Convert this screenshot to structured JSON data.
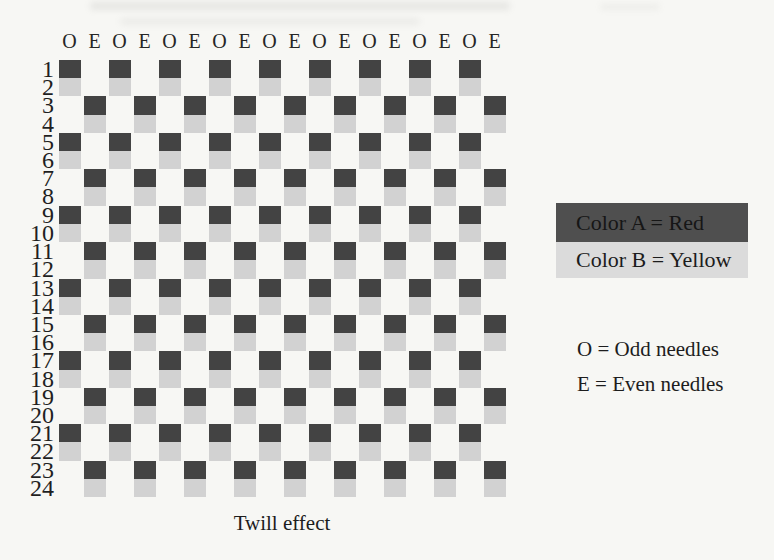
{
  "figure": {
    "caption": "Twill effect",
    "columns": 18,
    "courses": 24,
    "needle_header": [
      "O",
      "E",
      "O",
      "E",
      "O",
      "E",
      "O",
      "E",
      "O",
      "E",
      "O",
      "E",
      "O",
      "E",
      "O",
      "E",
      "O",
      "E"
    ],
    "course_numbers": [
      1,
      2,
      3,
      4,
      5,
      6,
      7,
      8,
      9,
      10,
      11,
      12,
      13,
      14,
      15,
      16,
      17,
      18,
      19,
      20,
      21,
      22,
      23,
      24
    ],
    "pattern_rows": [
      {
        "course": 1,
        "color": "A",
        "needles": "odd"
      },
      {
        "course": 2,
        "color": "B",
        "needles": "odd"
      },
      {
        "course": 3,
        "color": "A",
        "needles": "even"
      },
      {
        "course": 4,
        "color": "B",
        "needles": "even"
      },
      {
        "course": 5,
        "color": "A",
        "needles": "odd"
      },
      {
        "course": 6,
        "color": "B",
        "needles": "odd"
      },
      {
        "course": 7,
        "color": "A",
        "needles": "even"
      },
      {
        "course": 8,
        "color": "B",
        "needles": "even"
      },
      {
        "course": 9,
        "color": "A",
        "needles": "odd"
      },
      {
        "course": 10,
        "color": "B",
        "needles": "odd"
      },
      {
        "course": 11,
        "color": "A",
        "needles": "even"
      },
      {
        "course": 12,
        "color": "B",
        "needles": "even"
      },
      {
        "course": 13,
        "color": "A",
        "needles": "odd"
      },
      {
        "course": 14,
        "color": "B",
        "needles": "odd"
      },
      {
        "course": 15,
        "color": "A",
        "needles": "even"
      },
      {
        "course": 16,
        "color": "B",
        "needles": "even"
      },
      {
        "course": 17,
        "color": "A",
        "needles": "odd"
      },
      {
        "course": 18,
        "color": "B",
        "needles": "odd"
      },
      {
        "course": 19,
        "color": "A",
        "needles": "even"
      },
      {
        "course": 20,
        "color": "B",
        "needles": "even"
      },
      {
        "course": 21,
        "color": "A",
        "needles": "odd"
      },
      {
        "course": 22,
        "color": "B",
        "needles": "odd"
      },
      {
        "course": 23,
        "color": "A",
        "needles": "even"
      },
      {
        "course": 24,
        "color": "B",
        "needles": "even"
      }
    ]
  },
  "legend": {
    "color_a_label": "Color A = Red",
    "color_b_label": "Color B = Yellow",
    "odd_label": "O = Odd needles",
    "even_label": "E = Even needles"
  },
  "colors": {
    "color_a_square": "#434343",
    "color_b_square": "#d2d2d2",
    "legend_a_band": "#4f4f4f",
    "legend_b_band": "#dbdbdb",
    "legend_a_text": "#161616",
    "legend_b_text": "#1c1c1c",
    "page_background": "#f7f7f4"
  }
}
